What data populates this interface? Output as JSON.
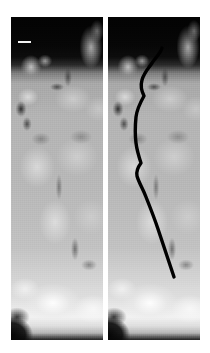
{
  "figure": {
    "type": "dual-panel grayscale micrograph",
    "background_color": "#ffffff",
    "width_px": 210,
    "height_px": 353,
    "panel_count": 2,
    "caption": ""
  },
  "panels": [
    {
      "id": "left",
      "role": "unannotated",
      "label": "",
      "x_px": 11,
      "y_px": 17,
      "width_px": 92,
      "height_px": 323,
      "description": "grayscale speckled tissue cross-section, dark background above surface, bright nodular tissue below",
      "has_overlay": false
    },
    {
      "id": "right",
      "role": "annotated",
      "label": "",
      "x_px": 108,
      "y_px": 17,
      "width_px": 92,
      "height_px": 323,
      "description": "same grayscale tissue cross-section with hand-traced black boundary curve overlay",
      "has_overlay": true
    }
  ],
  "scale_bar": {
    "present": true,
    "color": "#f2f2f2",
    "label": "",
    "length_px": 13,
    "thickness_px": 2,
    "panel": "left",
    "offset_x_px": 7,
    "offset_y_px": 24
  },
  "overlay_trace": {
    "name": "traced-boundary",
    "color": "#000000",
    "stroke_width_px": 3.4,
    "start_point": [
      54,
      31
    ],
    "end_point": [
      66,
      260
    ],
    "path": "M 54 31 C 52 37, 48 40, 44 46 C 40 52, 36 56, 34 63 C 32 70, 34 74, 36 79 C 32 86, 29 92, 28 100 C 27 110, 27 118, 28 126 C 29 134, 31 140, 33 146 C 30 150, 28 154, 29 159 C 31 166, 35 172, 38 180 C 42 190, 46 200, 50 212 C 54 224, 58 236, 62 248 C 64 254, 65 257, 66 260"
  },
  "colors": {
    "page_background": "#ffffff",
    "panel_dark": "#060606",
    "tissue_mid": "#b8b8b8",
    "tissue_bright": "#f5f5f5",
    "trace_stroke": "#000000",
    "scale_bar": "#f2f2f2"
  }
}
